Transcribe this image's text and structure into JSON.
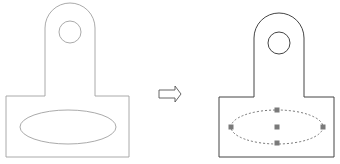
{
  "diagram": {
    "before": {
      "label": "unselected part",
      "stroke": "#9a9a9a",
      "ellipse": {
        "cx": 68,
        "cy": 127,
        "rx": 48,
        "ry": 17
      }
    },
    "arrow": {
      "label": "transforms to",
      "stroke": "#555555"
    },
    "after": {
      "label": "part with ellipse selected",
      "stroke": "#444444",
      "ellipse": {
        "cx": 277,
        "cy": 127,
        "rx": 46,
        "ry": 17,
        "style": "dashed"
      },
      "grips": [
        {
          "name": "grip-left",
          "x": 231,
          "y": 127
        },
        {
          "name": "grip-top",
          "x": 277,
          "y": 110
        },
        {
          "name": "grip-center",
          "x": 277,
          "y": 127
        },
        {
          "name": "grip-bottom",
          "x": 277,
          "y": 143
        },
        {
          "name": "grip-right",
          "x": 323,
          "y": 127
        }
      ],
      "grip_color": "#7a7a7a"
    }
  }
}
